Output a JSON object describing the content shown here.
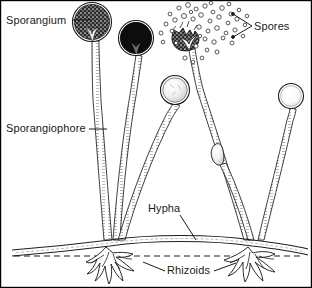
{
  "figure": {
    "frame_color": "#000000",
    "background_color": "#ffffff",
    "ink_color": "#1a1a1a",
    "width": 312,
    "height": 288
  },
  "labels": {
    "sporangium": "Sporangium",
    "sporangiophore": "Sporangiophore",
    "spores": "Spores",
    "hypha": "Hypha",
    "rhizoids": "Rhizoids"
  },
  "structures": {
    "substrate_line_style": "dashed",
    "substrate_y": 243,
    "sporangia": [
      {
        "name": "mature-dark-stippled",
        "cx": 92,
        "cy": 22,
        "r": 19,
        "shade": "dark-stippled"
      },
      {
        "name": "mature-black",
        "cx": 136,
        "cy": 38,
        "r": 17,
        "shade": "solid-black"
      },
      {
        "name": "burst-open",
        "cx": 187,
        "cy": 34,
        "r": 15,
        "shade": "ruptured"
      },
      {
        "name": "young-grey",
        "cx": 175,
        "cy": 90,
        "r": 14,
        "shade": "light-grey"
      },
      {
        "name": "young-pale",
        "cx": 291,
        "cy": 96,
        "r": 12,
        "shade": "pale"
      },
      {
        "name": "immature-tip",
        "cx": 215,
        "cy": 152,
        "r": 7,
        "shade": "blunt-tip"
      }
    ],
    "nodes": [
      {
        "name": "left-node",
        "x": 110,
        "y": 240
      },
      {
        "name": "right-node",
        "x": 252,
        "y": 240
      }
    ],
    "spore_cloud_count": 44
  }
}
